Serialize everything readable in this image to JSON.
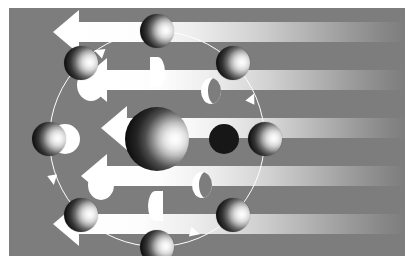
{
  "figure": {
    "background_color": "#7d7d7d",
    "line_color": "#ffffff",
    "panel": {
      "x": 9,
      "y": 8,
      "width": 396,
      "height": 248
    }
  },
  "sunlight": {
    "label": "sunlight",
    "direction": "right-to-left",
    "color": "#ffffff",
    "beams": [
      {
        "name": "beam-1",
        "top": 14,
        "height": 20,
        "head_half": 22,
        "head_len": 26,
        "shaft_left": 70
      },
      {
        "name": "beam-2",
        "top": 62,
        "height": 20,
        "head_half": 22,
        "head_len": 26,
        "shaft_left": 98
      },
      {
        "name": "beam-3",
        "top": 110,
        "height": 20,
        "head_half": 22,
        "head_len": 26,
        "shaft_left": 118
      },
      {
        "name": "beam-4",
        "top": 158,
        "height": 20,
        "head_half": 22,
        "head_len": 26,
        "shaft_left": 98
      },
      {
        "name": "beam-5",
        "top": 206,
        "height": 20,
        "head_half": 22,
        "head_len": 26,
        "shaft_left": 70
      }
    ]
  },
  "earth": {
    "name": "earth",
    "label": "Earth",
    "cx": 148,
    "cy": 131,
    "r": 32,
    "lit_side": "right"
  },
  "orbit": {
    "name": "moon-orbit",
    "cx": 148,
    "cy": 131,
    "r": 108,
    "direction": "counter-clockwise",
    "stroke": "#ffffff",
    "arrows": [
      {
        "name": "orbit-arrow-top",
        "x": 90,
        "y": 44,
        "rotate": -160
      },
      {
        "name": "orbit-arrow-upper-right",
        "x": 243,
        "y": 90,
        "rotate": -65
      },
      {
        "name": "orbit-arrow-left",
        "x": 44,
        "y": 172,
        "rotate": 80
      },
      {
        "name": "orbit-arrow-bottom",
        "x": 186,
        "y": 225,
        "rotate": 15
      }
    ]
  },
  "moons": [
    {
      "name": "moon-new",
      "phase": "New Moon",
      "angle": 0,
      "cx": 256,
      "cy": 131,
      "r": 17
    },
    {
      "name": "moon-waxing-crescent",
      "phase": "Waxing Crescent",
      "angle": 45,
      "cx": 224,
      "cy": 55,
      "r": 17
    },
    {
      "name": "moon-first-quarter",
      "phase": "First Quarter",
      "angle": 90,
      "cx": 148,
      "cy": 23,
      "r": 17
    },
    {
      "name": "moon-waxing-gibbous",
      "phase": "Waxing Gibbous",
      "angle": 135,
      "cx": 72,
      "cy": 55,
      "r": 17
    },
    {
      "name": "moon-full",
      "phase": "Full Moon",
      "angle": 180,
      "cx": 40,
      "cy": 131,
      "r": 17
    },
    {
      "name": "moon-waning-gibbous",
      "phase": "Waning Gibbous",
      "angle": 225,
      "cx": 72,
      "cy": 207,
      "r": 17
    },
    {
      "name": "moon-third-quarter",
      "phase": "Third Quarter",
      "angle": 270,
      "cx": 148,
      "cy": 239,
      "r": 17
    },
    {
      "name": "moon-waning-crescent",
      "phase": "Waning Crescent",
      "angle": 315,
      "cx": 224,
      "cy": 207,
      "r": 17
    }
  ],
  "phase_disks": [
    {
      "name": "phase-disk-full",
      "label": "Full Moon",
      "shape": "full",
      "cx": 56,
      "cy": 131,
      "w": 30,
      "h": 30
    },
    {
      "name": "phase-disk-waxing-gibbous",
      "label": "Waxing Gibbous",
      "shape": "gibbous",
      "cx": 82,
      "cy": 77,
      "w": 28,
      "h": 32
    },
    {
      "name": "phase-disk-first-quarter",
      "label": "First Quarter",
      "shape": "half-right",
      "cx": 148,
      "cy": 64,
      "w": 15,
      "h": 30
    },
    {
      "name": "phase-disk-waxing-crescent",
      "label": "Waxing Crescent",
      "shape": "crescent",
      "cx": 202,
      "cy": 83,
      "w": 20,
      "h": 26
    },
    {
      "name": "phase-disk-new",
      "label": "New Moon",
      "shape": "new",
      "cx": 215,
      "cy": 131,
      "w": 30,
      "h": 30
    },
    {
      "name": "phase-disk-waning-crescent",
      "label": "Waning Crescent",
      "shape": "crescent",
      "cx": 193,
      "cy": 177,
      "w": 20,
      "h": 26
    },
    {
      "name": "phase-disk-third-quarter",
      "label": "Third Quarter",
      "shape": "half-left",
      "cx": 146,
      "cy": 198,
      "w": 15,
      "h": 30
    },
    {
      "name": "phase-disk-waning-gibbous",
      "label": "Waning Gibbous",
      "shape": "gibbous",
      "cx": 92,
      "cy": 177,
      "w": 26,
      "h": 30
    }
  ]
}
